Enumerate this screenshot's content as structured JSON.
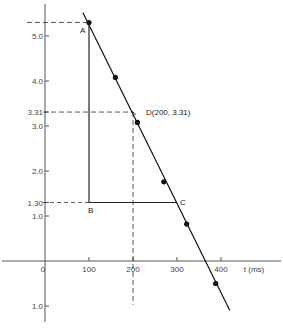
{
  "chart_data": {
    "type": "line",
    "title": "",
    "xlabel": "t (ms)",
    "ylabel": "",
    "xlim": [
      -100,
      520
    ],
    "ylim": [
      -1.3,
      5.6
    ],
    "grid": false,
    "x_ticks": [
      {
        "value": 0,
        "label": "0"
      },
      {
        "value": 100,
        "label": "100"
      },
      {
        "value": 200,
        "label": "200"
      },
      {
        "value": 300,
        "label": "300"
      },
      {
        "value": 400,
        "label": "400"
      }
    ],
    "y_ticks": [
      {
        "value": 5.0,
        "label": "5.0"
      },
      {
        "value": 4.0,
        "label": "4.0"
      },
      {
        "value": 3.31,
        "label": "3.31"
      },
      {
        "value": 3.0,
        "label": "3.0"
      },
      {
        "value": 2.0,
        "label": "2.0"
      },
      {
        "value": 1.3,
        "label": "1.30"
      },
      {
        "value": 1.0,
        "label": "1.0"
      },
      {
        "value": -1.0,
        "label": "1.0"
      }
    ],
    "series": [
      {
        "name": "data points",
        "kind": "scatter",
        "x": [
          100,
          160,
          210,
          270,
          322,
          388
        ],
        "y": [
          5.3,
          4.08,
          3.08,
          1.76,
          0.82,
          -0.5
        ]
      },
      {
        "name": "best-fit line",
        "kind": "line",
        "x": [
          86,
          420
        ],
        "y": [
          5.52,
          -1.1
        ]
      }
    ],
    "annotations": [
      {
        "label": "A",
        "x": 100,
        "y": 5.3
      },
      {
        "label": "B",
        "x": 100,
        "y": 1.3
      },
      {
        "label": "C",
        "x": 300,
        "y": 1.3
      },
      {
        "label": "D(200, 3.31)",
        "x": 200,
        "y": 3.31
      }
    ],
    "guides": {
      "triangle": {
        "A": [
          100,
          5.3
        ],
        "B": [
          100,
          1.3
        ],
        "C": [
          300,
          1.3
        ]
      },
      "dashed_horizontal": [
        5.3,
        3.31,
        1.3
      ],
      "dashed_vertical": [
        200
      ]
    }
  },
  "labels": {
    "x_axis": "t (ms)",
    "point_a": "A",
    "point_b": "B",
    "point_c": "C",
    "point_d": "D(200, 3.31)"
  }
}
